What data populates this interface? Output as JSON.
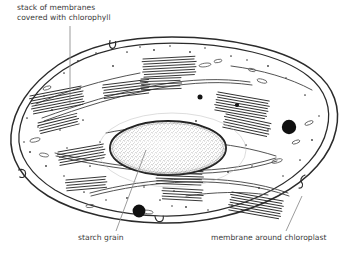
{
  "figure": {
    "type": "biological-diagram",
    "subject": "chloroplast",
    "style": "pen-and-ink electron micrograph drawing",
    "background_color": "#ffffff",
    "ink_color": "#2b2b2b",
    "text_color": "#3b3b3b"
  },
  "labels": {
    "grana": {
      "line1": "stack of membranes",
      "line2": "covered with chlorophyll"
    },
    "starch": "starch grain",
    "membrane": "membrane around chloroplast",
    "caption_partial": ""
  },
  "structures": {
    "envelope": "double membrane around chloroplast",
    "granum": "stack of membranes covered with chlorophyll",
    "starch_grain": "starch grain",
    "plastoglobulus": "dark lipid droplet",
    "lamella": "stroma lamella"
  },
  "counts": {
    "grana_stacks": 9,
    "plastoglobuli": 2,
    "starch_grains": 1
  }
}
